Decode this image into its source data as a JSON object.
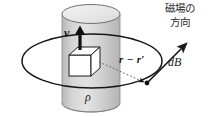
{
  "figure": {
    "width": 215,
    "height": 116,
    "background_color": "#ffffff",
    "line_color": "#1a1a1a",
    "cylinder_fill": "#cfcfcf",
    "cylinder_top_fill": "#e8e8e8",
    "cube_fill": "#ffffff"
  },
  "labels": {
    "velocity": "v",
    "separation_vector": "r − r′",
    "field_element": "dB",
    "charge_density": "ρ",
    "field_direction_line1": "磁場の",
    "field_direction_line2": "方向"
  },
  "elements": {
    "cylinder": "cylinder",
    "cylinder_top_ellipse": "cylinder-top",
    "cylinder_bottom_ellipse": "cylinder-bottom",
    "field_loop_ellipse": "magnetic-field-loop",
    "cube": "charge-element-cube",
    "velocity_arrow": "velocity-arrow",
    "db_arrow": "db-arrow",
    "dotted_arrow": "separation-vector-arrow",
    "field_point_dot": "field-point-dot"
  }
}
